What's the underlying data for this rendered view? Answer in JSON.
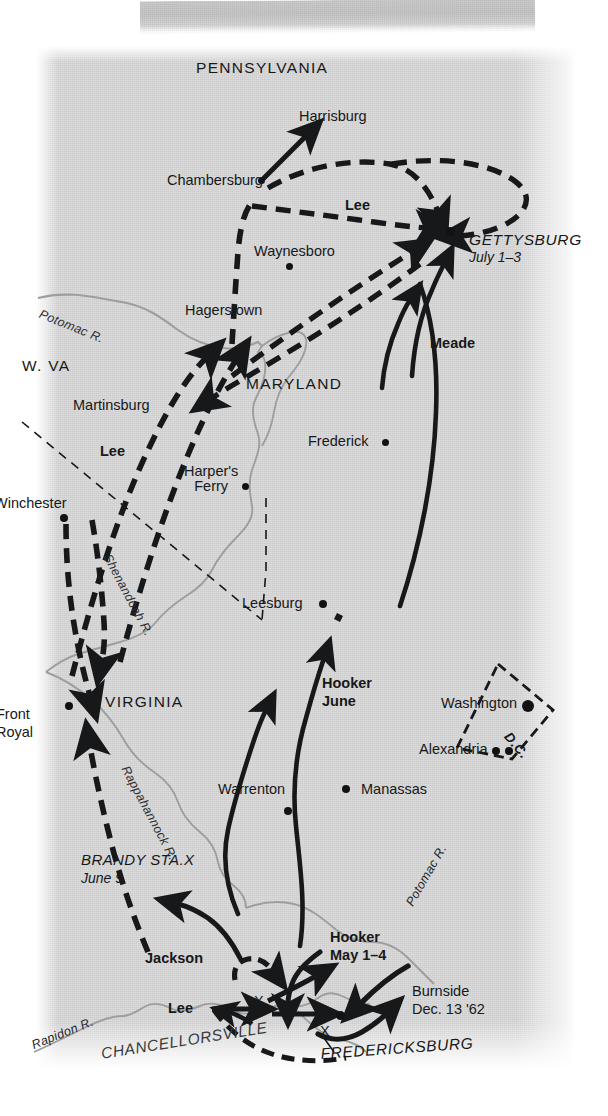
{
  "figure": {
    "kind": "historical-campaign-map",
    "background_color": "#dcdcdc",
    "ink_color": "#17181a",
    "river_color": "#9a9a9a"
  },
  "states": [
    {
      "id": "pennsylvania",
      "label": "PENNSYLVANIA",
      "x": 196,
      "y": 14
    },
    {
      "id": "maryland",
      "label": "MARYLAND",
      "x": 246,
      "y": 330
    },
    {
      "id": "west-virginia",
      "label": "W. VA",
      "x": 22,
      "y": 312
    },
    {
      "id": "virginia",
      "label": "VIRGINIA",
      "x": 105,
      "y": 648
    }
  ],
  "cities": [
    {
      "id": "harrisburg",
      "label": "Harrisburg",
      "lx": 299,
      "ly": 63,
      "dot": false
    },
    {
      "id": "chambersburg",
      "label": "Chambersburg",
      "lx": 167,
      "ly": 127,
      "dot": true,
      "dx": 261,
      "dy": 134
    },
    {
      "id": "waynesboro",
      "label": "Waynesboro",
      "lx": 254,
      "ly": 198,
      "dot": true,
      "dx": 289,
      "dy": 220
    },
    {
      "id": "hagerstown",
      "label": "Hagerstown",
      "lx": 185,
      "ly": 257,
      "dot": false
    },
    {
      "id": "martinsburg",
      "label": "Martinsburg",
      "lx": 73,
      "ly": 352,
      "dot": false
    },
    {
      "id": "frederick",
      "label": "Frederick",
      "lx": 308,
      "ly": 388,
      "dot": true,
      "dx": 385,
      "dy": 396
    },
    {
      "id": "harpers-ferry",
      "label": "Harper's",
      "label2": "Ferry",
      "lx": 184,
      "ly": 418,
      "dot": true,
      "dx": 245,
      "dy": 440
    },
    {
      "id": "winchester",
      "label": "Winchester",
      "lx": 2,
      "ly": 450,
      "dot": true,
      "dx": 63,
      "dy": 471
    },
    {
      "id": "leesburg",
      "label": "Leesburg",
      "lx": 242,
      "ly": 550,
      "dot": true,
      "dx": 322,
      "dy": 557
    },
    {
      "id": "washington",
      "label": "Washington",
      "lx": 441,
      "ly": 650,
      "dot": true,
      "dx": 527,
      "dy": 659,
      "big": true
    },
    {
      "id": "alexandria",
      "label": "Alexandria",
      "lx": 419,
      "ly": 696,
      "dot": true,
      "dx": 496,
      "dy": 704,
      "dot2x": 509,
      "dot2y": 704
    },
    {
      "id": "front-royal",
      "label": "Front",
      "label2": "Royal",
      "lx": 2,
      "ly": 664,
      "dot": true,
      "dx": 68,
      "dy": 659
    },
    {
      "id": "warrenton",
      "label": "Warrenton",
      "lx": 218,
      "ly": 736,
      "dot": true,
      "dx": 287,
      "dy": 764
    },
    {
      "id": "manassas",
      "label": "Manassas",
      "lx": 361,
      "ly": 736,
      "dot": true,
      "dx": 345,
      "dy": 742
    }
  ],
  "battles": [
    {
      "id": "gettysburg",
      "label": "GETTYSBURG",
      "date": "July 1–3",
      "lx": 469,
      "ly": 190,
      "dot": true,
      "dx": 449,
      "dy": 184
    },
    {
      "id": "brandy-station",
      "label": "BRANDY STA.X",
      "date": "June 9",
      "lx": 81,
      "ly": 810
    },
    {
      "id": "chancellorsville",
      "label": "CHANCELLORSVILLE",
      "lx": 106,
      "ly": 1008,
      "rotated": true
    },
    {
      "id": "fredericksburg",
      "label": "FREDERICKSBURG",
      "lx": 321,
      "ly": 1002,
      "rotated": true
    }
  ],
  "army_labels": [
    {
      "id": "lee-gettysburg",
      "label": "Lee",
      "x": 345,
      "y": 152
    },
    {
      "id": "meade",
      "label": "Meade",
      "x": 430,
      "y": 290
    },
    {
      "id": "lee-valley",
      "label": "Lee",
      "x": 100,
      "y": 398
    },
    {
      "id": "hooker-june",
      "label": "Hooker",
      "label2": "June",
      "x": 322,
      "y": 634
    },
    {
      "id": "hooker-may",
      "label": "Hooker",
      "label2": "May 1–4",
      "x": 330,
      "y": 888
    },
    {
      "id": "jackson",
      "label": "Jackson",
      "x": 145,
      "y": 905
    },
    {
      "id": "lee-chancellorsville",
      "label": "Lee",
      "x": 182,
      "y": 962
    },
    {
      "id": "burnside",
      "label": "Burnside",
      "label2": "Dec. 13 '62",
      "x": 412,
      "y": 943
    }
  ],
  "rivers": [
    {
      "id": "potomac-upper",
      "label": "Potomac R.",
      "x": 70,
      "y": 266
    },
    {
      "id": "shenandoah",
      "label": "Shenandoah R.",
      "x": 120,
      "y": 510
    },
    {
      "id": "rappahannock",
      "label": "Rappahannock R.",
      "x": 140,
      "y": 720
    },
    {
      "id": "potomac-lower",
      "label": "Potomac R.",
      "x": 440,
      "y": 840
    },
    {
      "id": "rapidon",
      "label": "Rapidon R.",
      "x": 65,
      "y": 990
    }
  ],
  "district": {
    "id": "district-of-columbia",
    "label": "D.C.",
    "x": 521,
    "y": 698
  },
  "battle_markers": [
    {
      "id": "marker-chancellorsville",
      "label": "X",
      "x": 257,
      "y": 955
    },
    {
      "id": "marker-fredericksburg",
      "label": "X",
      "x": 323,
      "y": 985
    }
  ]
}
